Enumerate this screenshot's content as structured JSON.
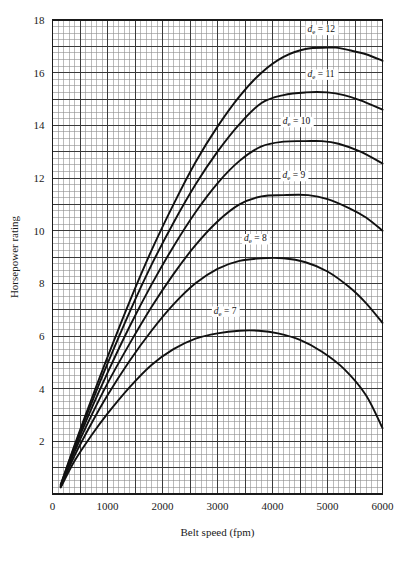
{
  "figure": {
    "background_color": "#ffffff",
    "grid_color_minor": "#8d8d8d",
    "grid_color_major": "#3a3a3a",
    "frame_color": "#1a1a1a",
    "curve_color": "#111111"
  },
  "chart_data": {
    "type": "line",
    "title": "",
    "xlabel": "Belt speed (fpm)",
    "ylabel": "Horsepower rating",
    "xlim": [
      0,
      6000
    ],
    "ylim": [
      0,
      18
    ],
    "xticks": [
      0,
      1000,
      2000,
      3000,
      4000,
      5000,
      6000
    ],
    "xtick_labels": [
      "0",
      "1000",
      "2000",
      "3000",
      "4000",
      "5000",
      "6000"
    ],
    "yticks": [
      2,
      4,
      6,
      8,
      10,
      12,
      14,
      16,
      18
    ],
    "ytick_labels": [
      "2",
      "4",
      "6",
      "8",
      "10",
      "12",
      "14",
      "16",
      "18"
    ],
    "grid": true,
    "grid_minor_step_x": 100,
    "grid_minor_step_y": 0.25,
    "grid_major_step_x": 500,
    "grid_major_step_y": 1,
    "legend_position": "inline-labels",
    "series": [
      {
        "name": "de = 12",
        "label_text": "d",
        "label_sub": "e",
        "label_rest": " = 12",
        "label_x": 4900,
        "label_y": 17.55,
        "peak_x": 5150,
        "peak_y": 16.95,
        "x": [
          150,
          400,
          700,
          1000,
          1400,
          1800,
          2200,
          2600,
          3000,
          3400,
          3800,
          4200,
          4600,
          5000,
          5150,
          5400,
          5700,
          6000
        ],
        "y": [
          0.35,
          1.85,
          3.55,
          5.2,
          7.3,
          9.25,
          11.0,
          12.6,
          13.95,
          15.1,
          16.0,
          16.6,
          16.9,
          16.95,
          16.95,
          16.85,
          16.7,
          16.45
        ]
      },
      {
        "name": "de = 11",
        "label_text": "d",
        "label_sub": "e",
        "label_rest": " = 11",
        "label_x": 4900,
        "label_y": 15.85,
        "peak_x": 5000,
        "peak_y": 15.25,
        "x": [
          150,
          400,
          700,
          1000,
          1400,
          1800,
          2200,
          2600,
          3000,
          3400,
          3800,
          4200,
          4600,
          5000,
          5300,
          5600,
          6000
        ],
        "y": [
          0.35,
          1.8,
          3.4,
          4.95,
          6.9,
          8.7,
          10.3,
          11.75,
          13.0,
          14.05,
          14.85,
          15.15,
          15.25,
          15.25,
          15.15,
          14.95,
          14.6
        ]
      },
      {
        "name": "de = 10",
        "label_text": "d",
        "label_sub": "e",
        "label_rest": " = 10",
        "label_x": 4450,
        "label_y": 14.05,
        "peak_x": 4900,
        "peak_y": 13.4,
        "x": [
          150,
          400,
          700,
          1000,
          1400,
          1800,
          2200,
          2600,
          3000,
          3400,
          3800,
          4200,
          4600,
          4900,
          5200,
          5600,
          6000
        ],
        "y": [
          0.3,
          1.7,
          3.2,
          4.6,
          6.35,
          7.95,
          9.4,
          10.7,
          11.8,
          12.65,
          13.2,
          13.38,
          13.4,
          13.4,
          13.3,
          13.0,
          12.55
        ]
      },
      {
        "name": "de = 9",
        "label_text": "d",
        "label_sub": "e",
        "label_rest": " = 9",
        "label_x": 4400,
        "label_y": 12.0,
        "peak_x": 4650,
        "peak_y": 11.35,
        "x": [
          150,
          400,
          700,
          1000,
          1400,
          1800,
          2200,
          2600,
          3000,
          3400,
          3800,
          4200,
          4650,
          5000,
          5400,
          5700,
          6000
        ],
        "y": [
          0.3,
          1.6,
          2.95,
          4.2,
          5.7,
          7.1,
          8.35,
          9.45,
          10.35,
          11.0,
          11.3,
          11.35,
          11.35,
          11.2,
          10.85,
          10.5,
          10.0
        ]
      },
      {
        "name": "de = 8",
        "label_text": "d",
        "label_sub": "e",
        "label_rest": " = 8",
        "label_x": 3700,
        "label_y": 9.6,
        "peak_x": 4200,
        "peak_y": 8.95,
        "x": [
          150,
          400,
          700,
          1000,
          1400,
          1800,
          2200,
          2600,
          3000,
          3400,
          3800,
          4200,
          4600,
          5000,
          5400,
          5700,
          6000
        ],
        "y": [
          0.28,
          1.45,
          2.65,
          3.75,
          5.05,
          6.2,
          7.2,
          8.0,
          8.55,
          8.85,
          8.95,
          8.95,
          8.8,
          8.45,
          7.85,
          7.25,
          6.5
        ]
      },
      {
        "name": "de = 7",
        "label_text": "d",
        "label_sub": "e",
        "label_rest": " = 7",
        "label_x": 3150,
        "label_y": 6.85,
        "peak_x": 3750,
        "peak_y": 6.2,
        "x": [
          150,
          400,
          700,
          1000,
          1400,
          1800,
          2200,
          2600,
          3000,
          3400,
          3750,
          4100,
          4500,
          4900,
          5300,
          5700,
          6000
        ],
        "y": [
          0.25,
          1.25,
          2.2,
          3.05,
          4.05,
          4.9,
          5.5,
          5.9,
          6.1,
          6.2,
          6.2,
          6.1,
          5.85,
          5.4,
          4.75,
          3.75,
          2.5
        ]
      }
    ]
  }
}
